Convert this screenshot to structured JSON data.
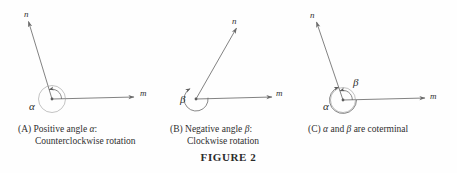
{
  "figure": {
    "number_label": "FIGURE 2",
    "stroke_color": "#6b6b6b",
    "text_color": "#2f2f2f",
    "background_color": "#fefefe"
  },
  "panels": [
    {
      "id": "A",
      "caption_prefix": "(A)",
      "caption_line1": "Positive angle",
      "caption_symbol": "α",
      "caption_punct": ":",
      "caption_line2": "Counterclockwise rotation",
      "ray_initial_label": "m",
      "ray_terminal_label": "n",
      "angle_label": "α",
      "rotation": "counterclockwise"
    },
    {
      "id": "B",
      "caption_prefix": "(B)",
      "caption_line1": "Negative angle",
      "caption_symbol": "β",
      "caption_punct": ":",
      "caption_line2": "Clockwise rotation",
      "ray_initial_label": "m",
      "ray_terminal_label": "n",
      "angle_label": "β",
      "rotation": "clockwise"
    },
    {
      "id": "C",
      "caption_prefix": "(C)",
      "caption_symbol_1": "α",
      "caption_mid": "and",
      "caption_symbol_2": "β",
      "caption_tail": "are coterminal",
      "ray_initial_label": "m",
      "ray_terminal_label": "n",
      "angle_label_1": "α",
      "angle_label_2": "β",
      "rotation": "both"
    }
  ]
}
